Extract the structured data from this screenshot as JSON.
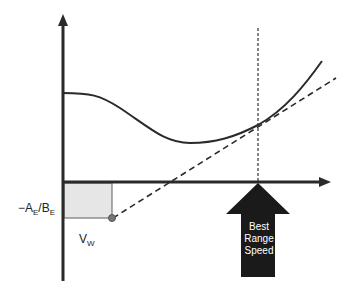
{
  "diagram": {
    "title": "",
    "y_intercept_label": {
      "base": "−A",
      "sub1": "E",
      "mid": "/B",
      "sub2": "E"
    },
    "wind_label": {
      "base": "V",
      "sub": "W"
    },
    "arrow_label": [
      "Best",
      "Range",
      "Speed"
    ],
    "elements": {
      "axes": "y-axis and x-axis with arrowheads",
      "curve": "power/drag curve",
      "tangent": "dashed tangent line from wind offset point",
      "reference_line": "dotted vertical line at best range speed",
      "shaded_region": "rectangle between origin and wind offset"
    },
    "colors": {
      "line": "#2a2a2a",
      "shade": "#e6e6e6",
      "arrow": "#1a1a1a",
      "point": "#777777"
    }
  }
}
